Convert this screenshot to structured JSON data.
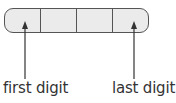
{
  "diagram": {
    "cells": 4,
    "box_fill": "#ebebeb",
    "border_color": "#555555",
    "labels": {
      "first": "first digit",
      "last": "last digit"
    },
    "arrows": [
      {
        "name": "first-digit-arrow",
        "points_to_cell": 1
      },
      {
        "name": "last-digit-arrow",
        "points_to_cell": 4
      }
    ]
  }
}
